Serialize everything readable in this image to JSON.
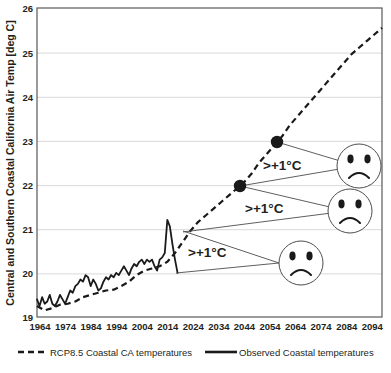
{
  "chart_data": {
    "type": "line",
    "title": "",
    "xlabel": "",
    "ylabel": "Central and Southern Coastal California Air Temp [deg C]",
    "xlim": [
      1964,
      2099
    ],
    "ylim": [
      19,
      26
    ],
    "grid": true,
    "gridlines_axis": "y",
    "legend_position": "bottom",
    "y_ticks": [
      "19",
      "20",
      "21",
      "22",
      "23",
      "24",
      "25",
      "26"
    ],
    "x_ticks": [
      "1964",
      "1974",
      "1984",
      "1994",
      "2004",
      "2014",
      "2024",
      "2034",
      "2044",
      "2054",
      "2064",
      "2074",
      "2084",
      "2094"
    ],
    "series": [
      {
        "name": "RCP8.5 Coastal CA temperatures",
        "style": "dashed",
        "color": "#1a1a1a",
        "x": [
          1964,
          1967,
          1970,
          1973,
          1976,
          1979,
          1982,
          1985,
          1988,
          1991,
          1994,
          1997,
          2000,
          2003,
          2006,
          2009,
          2012,
          2015,
          2018,
          2021,
          2024,
          2027,
          2030,
          2033,
          2036,
          2039,
          2042,
          2045,
          2048,
          2051,
          2054,
          2057,
          2060,
          2063,
          2066,
          2069,
          2072,
          2075,
          2078,
          2081,
          2084,
          2087,
          2090,
          2093,
          2096,
          2099
        ],
        "y": [
          19.25,
          19.15,
          19.2,
          19.28,
          19.3,
          19.35,
          19.45,
          19.5,
          19.55,
          19.6,
          19.62,
          19.7,
          19.8,
          19.95,
          20.05,
          20.1,
          20.15,
          20.25,
          20.45,
          20.7,
          20.95,
          21.15,
          21.3,
          21.45,
          21.6,
          21.75,
          21.9,
          22.05,
          22.25,
          22.5,
          22.7,
          22.9,
          23.1,
          23.35,
          23.55,
          23.75,
          23.95,
          24.15,
          24.35,
          24.55,
          24.75,
          24.95,
          25.1,
          25.25,
          25.4,
          25.55
        ]
      },
      {
        "name": "Observed Coastal temperatures",
        "style": "solid",
        "color": "#1a1a1a",
        "x": [
          1964,
          1965,
          1966,
          1967,
          1968,
          1969,
          1970,
          1971,
          1972,
          1973,
          1974,
          1975,
          1976,
          1977,
          1978,
          1979,
          1980,
          1981,
          1982,
          1983,
          1984,
          1985,
          1986,
          1987,
          1988,
          1989,
          1990,
          1991,
          1992,
          1993,
          1994,
          1995,
          1996,
          1997,
          1998,
          1999,
          2000,
          2001,
          2002,
          2003,
          2004,
          2005,
          2006,
          2007,
          2008,
          2009,
          2010,
          2011,
          2012,
          2013,
          2014,
          2015,
          2016,
          2017,
          2018,
          2019
        ],
        "y": [
          19.4,
          19.25,
          19.45,
          19.3,
          19.35,
          19.5,
          19.3,
          19.25,
          19.35,
          19.5,
          19.4,
          19.3,
          19.45,
          19.6,
          19.55,
          19.7,
          19.75,
          19.85,
          19.8,
          19.95,
          19.9,
          19.7,
          19.85,
          19.75,
          19.6,
          19.65,
          19.8,
          19.9,
          19.85,
          19.95,
          19.9,
          20.0,
          19.95,
          20.05,
          20.15,
          20.05,
          19.95,
          20.1,
          20.2,
          20.15,
          20.25,
          20.3,
          20.2,
          20.3,
          20.25,
          20.3,
          20.15,
          20.05,
          20.3,
          20.35,
          20.45,
          21.2,
          21.05,
          20.65,
          20.3,
          20.0
        ]
      }
    ],
    "markers": [
      {
        "name": "milestone-2044",
        "x": 2044,
        "y": 22.0
      },
      {
        "name": "milestone-2060",
        "x": 2060,
        "y": 23.0
      }
    ],
    "annotations": [
      {
        "name": "delta-lower",
        "label": ">+1°C"
      },
      {
        "name": "delta-middle",
        "label": ">+1°C"
      },
      {
        "name": "delta-upper",
        "label": ">+1°C"
      }
    ],
    "face_icons": [
      {
        "name": "sad-face-lower",
        "expression": "sad"
      },
      {
        "name": "sad-face-middle",
        "expression": "sad"
      },
      {
        "name": "sad-face-upper",
        "expression": "sad"
      }
    ]
  },
  "legend": {
    "items": [
      {
        "label": "RCP8.5 Coastal CA temperatures",
        "style": "dashed"
      },
      {
        "label": "Observed Coastal temperatures",
        "style": "solid"
      }
    ]
  }
}
